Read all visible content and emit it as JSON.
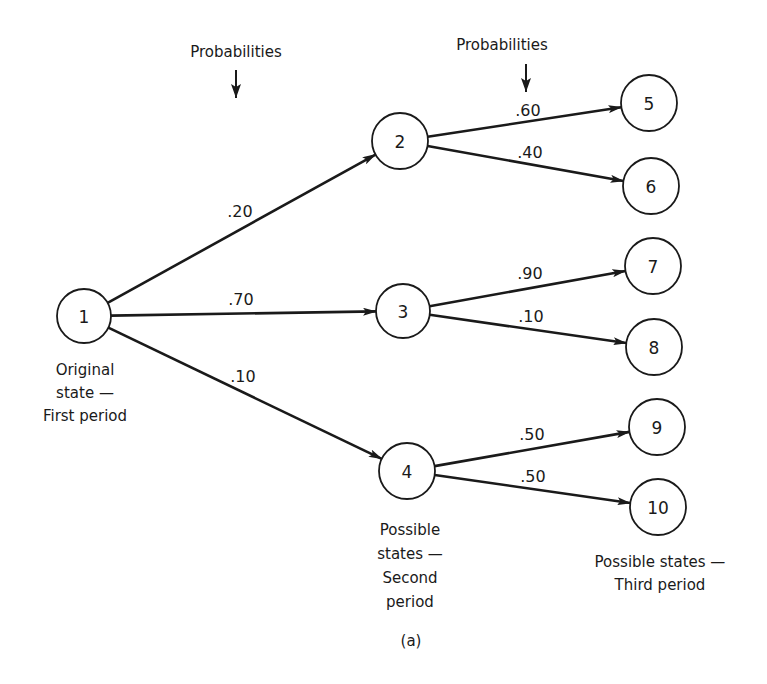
{
  "figure": {
    "header_labels": [
      {
        "id": "probabilities-1",
        "text": "Probabilities",
        "x": 236,
        "y": 57,
        "arrow_x": 236,
        "arrow_y1": 70,
        "arrow_y2": 98
      },
      {
        "id": "probabilities-2",
        "text": "Probabilities",
        "x": 502,
        "y": 50,
        "arrow_x": 526,
        "arrow_y1": 64,
        "arrow_y2": 92
      }
    ],
    "nodes": [
      {
        "id": "1",
        "label": "1",
        "x": 84,
        "y": 316,
        "r": 27,
        "stage": "first"
      },
      {
        "id": "2",
        "label": "2",
        "x": 400,
        "y": 141,
        "r": 28,
        "stage": "second"
      },
      {
        "id": "3",
        "label": "3",
        "x": 403,
        "y": 311,
        "r": 27,
        "stage": "second"
      },
      {
        "id": "4",
        "label": "4",
        "x": 407,
        "y": 471,
        "r": 28,
        "stage": "second"
      },
      {
        "id": "5",
        "label": "5",
        "x": 649,
        "y": 103,
        "r": 28,
        "stage": "third"
      },
      {
        "id": "6",
        "label": "6",
        "x": 651,
        "y": 186,
        "r": 28,
        "stage": "third"
      },
      {
        "id": "7",
        "label": "7",
        "x": 653,
        "y": 266,
        "r": 28,
        "stage": "third"
      },
      {
        "id": "8",
        "label": "8",
        "x": 654,
        "y": 347,
        "r": 28,
        "stage": "third"
      },
      {
        "id": "9",
        "label": "9",
        "x": 657,
        "y": 427,
        "r": 28,
        "stage": "third"
      },
      {
        "id": "10",
        "label": "10",
        "x": 658,
        "y": 507,
        "r": 28,
        "stage": "third"
      }
    ],
    "edges": [
      {
        "from": "1",
        "to": "2",
        "probability": ".20",
        "label_x": 240,
        "label_y": 217
      },
      {
        "from": "1",
        "to": "3",
        "probability": ".70",
        "label_x": 241,
        "label_y": 305
      },
      {
        "from": "1",
        "to": "4",
        "probability": ".10",
        "label_x": 243,
        "label_y": 382
      },
      {
        "from": "2",
        "to": "5",
        "probability": ".60",
        "label_x": 528,
        "label_y": 116
      },
      {
        "from": "2",
        "to": "6",
        "probability": ".40",
        "label_x": 530,
        "label_y": 158
      },
      {
        "from": "3",
        "to": "7",
        "probability": ".90",
        "label_x": 530,
        "label_y": 279
      },
      {
        "from": "3",
        "to": "8",
        "probability": ".10",
        "label_x": 531,
        "label_y": 322
      },
      {
        "from": "4",
        "to": "9",
        "probability": ".50",
        "label_x": 532,
        "label_y": 440
      },
      {
        "from": "4",
        "to": "10",
        "probability": ".50",
        "label_x": 533,
        "label_y": 482
      }
    ],
    "captions": [
      {
        "id": "original-state",
        "lines": [
          "Original",
          "state —",
          "First period"
        ],
        "x": 85,
        "y": 375,
        "line_height": 23
      },
      {
        "id": "second-period",
        "lines": [
          "Possible",
          "states —",
          "Second",
          "period"
        ],
        "x": 410,
        "y": 535,
        "line_height": 24
      },
      {
        "id": "third-period",
        "lines": [
          "Possible states —",
          "Third period"
        ],
        "x": 660,
        "y": 567,
        "line_height": 23
      }
    ],
    "subfigure_label": {
      "text": "(a)",
      "x": 411,
      "y": 646
    }
  },
  "colors": {
    "ink": "#1a1a1a",
    "background": "#ffffff"
  }
}
